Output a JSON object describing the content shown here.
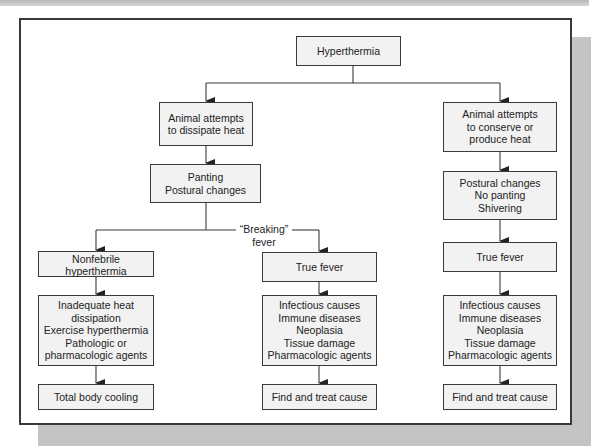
{
  "diagram": {
    "title": "Hyperthermia",
    "nodes": {
      "root": "Hyperthermia",
      "dissipate": "Animal attempts\nto dissipate heat",
      "conserve": "Animal attempts\nto conserve or\nproduce heat",
      "panting": "Panting\nPostural changes",
      "no_panting": "Postural changes\nNo panting\nShivering",
      "nonfebrile": "Nonfebrile\nhyperthermia",
      "true_fever_mid": "True fever",
      "true_fever_right": "True fever",
      "nonfebrile_causes": "Inadequate heat\ndissipation\nExercise hyperthermia\nPathologic or\npharmacologic agents",
      "fever_causes_mid": "Infectious causes\nImmune diseases\nNeoplasia\nTissue damage\nPharmacologic agents",
      "fever_causes_right": "Infectious causes\nImmune diseases\nNeoplasia\nTissue damage\nPharmacologic agents",
      "treat_left": "Total body cooling",
      "treat_mid": "Find and treat cause",
      "treat_right": "Find and treat cause"
    },
    "edge_labels": {
      "breaking_fever": "“Breaking”\nfever"
    },
    "edges": [
      [
        "root",
        "dissipate"
      ],
      [
        "root",
        "conserve"
      ],
      [
        "dissipate",
        "panting"
      ],
      [
        "panting",
        "nonfebrile"
      ],
      [
        "panting",
        "true_fever_mid"
      ],
      [
        "conserve",
        "no_panting"
      ],
      [
        "no_panting",
        "true_fever_right"
      ],
      [
        "nonfebrile",
        "nonfebrile_causes"
      ],
      [
        "true_fever_mid",
        "fever_causes_mid"
      ],
      [
        "true_fever_right",
        "fever_causes_right"
      ],
      [
        "nonfebrile_causes",
        "treat_left"
      ],
      [
        "fever_causes_mid",
        "treat_mid"
      ],
      [
        "fever_causes_right",
        "treat_right"
      ]
    ],
    "colors": {
      "box_fill": "#f2f2f2",
      "stroke": "#3a3a3a",
      "frame_shadow": "#c4c4c4"
    }
  }
}
